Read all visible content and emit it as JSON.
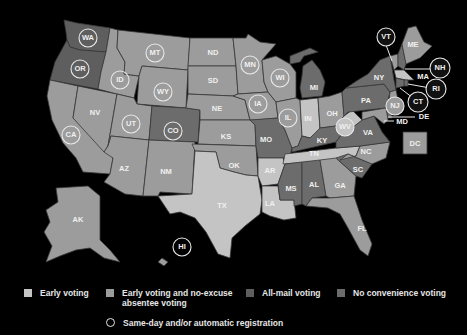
{
  "colors": {
    "background": "#000000",
    "early_voting": "#c4c4c4",
    "early_and_absentee": "#9c9c9c",
    "all_mail": "#5e5e5e",
    "no_convenience": "#6c6c6c",
    "label": "#f0f0f0"
  },
  "states": [
    {
      "abbr": "WA",
      "category": "all_mail",
      "circled": true
    },
    {
      "abbr": "OR",
      "category": "all_mail",
      "circled": true
    },
    {
      "abbr": "CA",
      "category": "early_and_absentee",
      "circled": true
    },
    {
      "abbr": "NV",
      "category": "early_and_absentee",
      "circled": false
    },
    {
      "abbr": "ID",
      "category": "early_and_absentee",
      "circled": true
    },
    {
      "abbr": "MT",
      "category": "early_and_absentee",
      "circled": true
    },
    {
      "abbr": "WY",
      "category": "early_and_absentee",
      "circled": true
    },
    {
      "abbr": "UT",
      "category": "early_and_absentee",
      "circled": true
    },
    {
      "abbr": "AZ",
      "category": "early_and_absentee",
      "circled": false
    },
    {
      "abbr": "CO",
      "category": "all_mail",
      "circled": true
    },
    {
      "abbr": "NM",
      "category": "early_and_absentee",
      "circled": false
    },
    {
      "abbr": "ND",
      "category": "early_and_absentee",
      "circled": false
    },
    {
      "abbr": "SD",
      "category": "early_and_absentee",
      "circled": false
    },
    {
      "abbr": "NE",
      "category": "early_and_absentee",
      "circled": false
    },
    {
      "abbr": "KS",
      "category": "early_and_absentee",
      "circled": false
    },
    {
      "abbr": "OK",
      "category": "early_and_absentee",
      "circled": false
    },
    {
      "abbr": "TX",
      "category": "early_voting",
      "circled": false
    },
    {
      "abbr": "MN",
      "category": "early_and_absentee",
      "circled": true
    },
    {
      "abbr": "IA",
      "category": "early_and_absentee",
      "circled": true
    },
    {
      "abbr": "MO",
      "category": "no_convenience",
      "circled": false
    },
    {
      "abbr": "AR",
      "category": "early_voting",
      "circled": false
    },
    {
      "abbr": "LA",
      "category": "early_voting",
      "circled": false
    },
    {
      "abbr": "WI",
      "category": "early_and_absentee",
      "circled": true
    },
    {
      "abbr": "IL",
      "category": "early_and_absentee",
      "circled": true
    },
    {
      "abbr": "MI",
      "category": "no_convenience",
      "circled": false
    },
    {
      "abbr": "IN",
      "category": "early_voting",
      "circled": false
    },
    {
      "abbr": "OH",
      "category": "early_and_absentee",
      "circled": false
    },
    {
      "abbr": "KY",
      "category": "no_convenience",
      "circled": false
    },
    {
      "abbr": "TN",
      "category": "early_voting",
      "circled": false
    },
    {
      "abbr": "MS",
      "category": "no_convenience",
      "circled": false
    },
    {
      "abbr": "AL",
      "category": "no_convenience",
      "circled": false
    },
    {
      "abbr": "GA",
      "category": "early_and_absentee",
      "circled": false
    },
    {
      "abbr": "FL",
      "category": "early_and_absentee",
      "circled": false
    },
    {
      "abbr": "SC",
      "category": "no_convenience",
      "circled": false
    },
    {
      "abbr": "NC",
      "category": "early_and_absentee",
      "circled": false
    },
    {
      "abbr": "VA",
      "category": "no_convenience",
      "circled": false
    },
    {
      "abbr": "WV",
      "category": "early_voting",
      "circled": true
    },
    {
      "abbr": "PA",
      "category": "no_convenience",
      "circled": false
    },
    {
      "abbr": "NY",
      "category": "no_convenience",
      "circled": false
    },
    {
      "abbr": "VT",
      "category": "early_and_absentee",
      "circled": true
    },
    {
      "abbr": "NH",
      "category": "no_convenience",
      "circled": true
    },
    {
      "abbr": "ME",
      "category": "early_and_absentee",
      "circled": true
    },
    {
      "abbr": "MA",
      "category": "early_voting",
      "circled": false
    },
    {
      "abbr": "RI",
      "category": "no_convenience",
      "circled": true
    },
    {
      "abbr": "CT",
      "category": "no_convenience",
      "circled": true
    },
    {
      "abbr": "NJ",
      "category": "early_and_absentee",
      "circled": true
    },
    {
      "abbr": "DE",
      "category": "no_convenience",
      "circled": false
    },
    {
      "abbr": "MD",
      "category": "early_and_absentee",
      "circled": false
    },
    {
      "abbr": "DC",
      "category": "early_and_absentee",
      "circled": false
    },
    {
      "abbr": "AK",
      "category": "early_and_absentee",
      "circled": false
    },
    {
      "abbr": "HI",
      "category": "early_and_absentee",
      "circled": true
    }
  ],
  "labels": {
    "WA": "WA",
    "OR": "OR",
    "CA": "CA",
    "NV": "NV",
    "ID": "ID",
    "MT": "MT",
    "WY": "WY",
    "UT": "UT",
    "AZ": "AZ",
    "CO": "CO",
    "NM": "NM",
    "ND": "ND",
    "SD": "SD",
    "NE": "NE",
    "KS": "KS",
    "OK": "OK",
    "TX": "TX",
    "MN": "MN",
    "IA": "IA",
    "MO": "MO",
    "AR": "AR",
    "LA": "LA",
    "WI": "WI",
    "IL": "IL",
    "MI": "MI",
    "IN": "IN",
    "OH": "OH",
    "KY": "KY",
    "TN": "TN",
    "MS": "MS",
    "AL": "AL",
    "GA": "GA",
    "FL": "FL",
    "SC": "SC",
    "NC": "NC",
    "VA": "VA",
    "WV": "WV",
    "PA": "PA",
    "NY": "NY",
    "VT": "VT",
    "NH": "NH",
    "ME": "ME",
    "MA": "MA",
    "RI": "RI",
    "CT": "CT",
    "NJ": "NJ",
    "DE": "DE",
    "MD": "MD",
    "DC": "DC",
    "AK": "AK",
    "HI": "HI"
  },
  "legend": {
    "items": [
      {
        "key": "early_voting",
        "label": "Early voting"
      },
      {
        "key": "early_and_absentee",
        "label": "Early voting and no-excuse",
        "label_line2": "absentee voting"
      },
      {
        "key": "all_mail",
        "label": "All-mail voting"
      },
      {
        "key": "no_convenience",
        "label": "No convenience voting"
      }
    ],
    "circle_label": "Same-day and/or automatic registration"
  }
}
